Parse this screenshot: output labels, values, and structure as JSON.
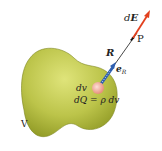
{
  "diagram": {
    "colors": {
      "volume_fill_light": "#d6dc6a",
      "volume_fill_dark": "#8f9a22",
      "volume_edge": "#6f7818",
      "charge_element": "#f0a898",
      "unit_vector": "#2e5fb0",
      "field_vector": "#e2401e",
      "line": "#333333",
      "text": "#222222"
    },
    "labels": {
      "volume": "V",
      "volume_element": "dv",
      "charge_element": "dQ = ρ dv",
      "distance_vector": "R",
      "unit_vector_base": "e",
      "unit_vector_sub": "R",
      "field_point": "P",
      "field_element_d": "d",
      "field_element_E": "E"
    }
  }
}
